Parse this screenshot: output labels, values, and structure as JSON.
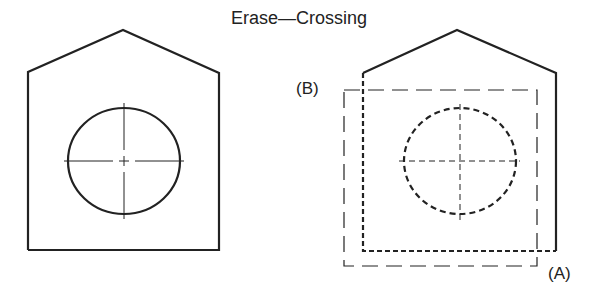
{
  "title": "Erase—Crossing",
  "labels": {
    "b": "(B)",
    "a": "(A)"
  },
  "colors": {
    "stroke": "#222222",
    "background": "#ffffff"
  },
  "figures": [
    {
      "name": "before",
      "outline": "solid",
      "circle": "solid"
    },
    {
      "name": "after-crossing-selection",
      "outline": "dashed-highlight",
      "circle": "dashed-highlight",
      "selection_window": {
        "from": "(A)",
        "to": "(B)",
        "style": "long-dash"
      }
    }
  ]
}
